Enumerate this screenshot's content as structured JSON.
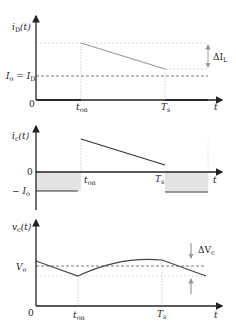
{
  "figure": {
    "panels": [
      {
        "id": "iD",
        "ylabel": "i",
        "ylabel_sub": "D",
        "ylabel_arg": "(t)",
        "origin_label": "0",
        "level_label_left": "I",
        "level_label_left_sub": "o",
        "level_label_eq": " = I",
        "level_label_eq_sub": "D",
        "x_ticks": [
          {
            "label": "t",
            "sub": "on"
          },
          {
            "label": "T",
            "sub": "s"
          }
        ],
        "x_axis_label": "t",
        "ripple_label": "ΔI",
        "ripple_label_sub": "L"
      },
      {
        "id": "ic",
        "ylabel": "i",
        "ylabel_sub": "c",
        "ylabel_arg": "(t)",
        "zero_label": "0",
        "neg_label": "− I",
        "neg_label_sub": "o",
        "x_ticks": [
          {
            "label": "t",
            "sub": "on"
          },
          {
            "label": "T",
            "sub": "s"
          }
        ],
        "x_axis_label": "t"
      },
      {
        "id": "vc",
        "ylabel": "v",
        "ylabel_sub": "c",
        "ylabel_arg": "(t)",
        "origin_label": "0",
        "level_label": "V",
        "level_label_sub": "o",
        "x_ticks": [
          {
            "label": "t",
            "sub": "on"
          },
          {
            "label": "T",
            "sub": "s"
          }
        ],
        "x_axis_label": "t",
        "ripple_label": "ΔV",
        "ripple_label_sub": "c"
      }
    ],
    "colors": {
      "axis": "#222222",
      "trace_iD": "#9a9a9a",
      "trace_ic": "#333333",
      "trace_vc": "#444444",
      "dashed": "#555555",
      "dotted": "#bbbbbb",
      "shade": "#e2e2e2"
    }
  }
}
